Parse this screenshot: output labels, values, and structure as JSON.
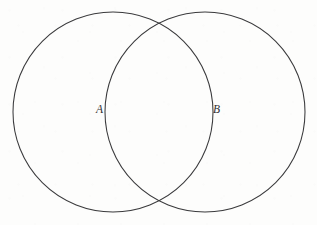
{
  "figure": {
    "kind": "venn-diagram",
    "width": 317,
    "height": 225,
    "background_color": "#fdfdfc",
    "stroke_color": "#3a3a3c",
    "label_color": "#2e2e30"
  },
  "labels": {
    "set_a": "A",
    "set_b": "B"
  },
  "chart_data": {
    "type": "diagram",
    "title": "",
    "subtitle": "",
    "xlabel": "",
    "ylabel": "",
    "legend": [],
    "annotations": [
      "A",
      "B"
    ],
    "sets": [
      {
        "name": "A",
        "label": "A",
        "label_x": 100,
        "label_y": 110,
        "center_x": 113,
        "center_y": 112,
        "radius": 100,
        "fill": "none",
        "stroke": "#3a3a3c"
      },
      {
        "name": "B",
        "label": "B",
        "label_x": 217,
        "label_y": 110,
        "center_x": 205,
        "center_y": 112,
        "radius": 100,
        "fill": "none",
        "stroke": "#3a3a3c"
      }
    ],
    "intersections": [
      {
        "x": 159,
        "y": 28
      },
      {
        "x": 159,
        "y": 197
      }
    ],
    "regions": [
      "A only",
      "A and B",
      "B only"
    ]
  }
}
